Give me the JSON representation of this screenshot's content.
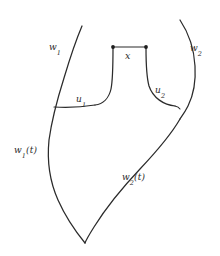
{
  "figure": {
    "background_color": "#ffffff",
    "stroke_color": "#2b2b2b",
    "width": 220,
    "height": 256,
    "labels": {
      "w1": {
        "base": "w",
        "sub": "1",
        "suffix": ""
      },
      "w2": {
        "base": "w",
        "sub": "2",
        "suffix": ""
      },
      "u1": {
        "base": "u",
        "sub": "1",
        "suffix": ""
      },
      "u2": {
        "base": "u",
        "sub": "2",
        "suffix": ""
      },
      "w1t": {
        "base": "w",
        "sub": "1",
        "suffix": "(t)"
      },
      "w2t": {
        "base": "w",
        "sub": "2",
        "suffix": "(t)"
      },
      "x": {
        "base": "x",
        "sub": "",
        "suffix": ""
      }
    },
    "label_text": {
      "w1": "w1",
      "w2": "w2",
      "u1": "u1",
      "u2": "u2",
      "w1t": "w1(t)",
      "w2t": "w2(t)",
      "x": "x"
    },
    "endpoints": [
      {
        "name": "x-left-endpoint",
        "cx": 113,
        "cy": 47,
        "r": 1.9
      },
      {
        "name": "x-right-endpoint",
        "cx": 146,
        "cy": 47,
        "r": 1.9
      }
    ],
    "paths": {
      "outer_left": "M 82 26 C 74 46 66 74 58 98 C 52 118 47 142 48 163 C 49 186 60 212 85 243",
      "outer_right": "M 180 20 C 191 42 196 66 193 88 C 190 105 184 112 180 118",
      "lower_right": "M 180 118 C 167 140 140 170 119 195 C 104 213 91 230 85 243",
      "segment_x": "M 113 47 L 146 47",
      "notch_left_stem": "M 113 48 C 113 62 113 78 111 90 C 109 99 102 104 94 105",
      "notch_right_stem": "M 146 48 C 146 62 146 76 149 87 C 153 99 165 105 176 106",
      "u1_line": "M 54 107 C 66 107 82 107 94 105",
      "u2_arc": "M 176 106 C 178 106 179 107 180 108"
    }
  }
}
